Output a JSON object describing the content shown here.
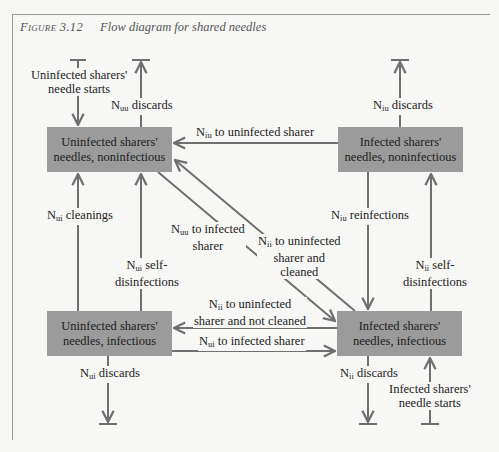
{
  "figure": {
    "number_label": "Figure 3.12",
    "title": "Flow diagram for shared needles"
  },
  "boxes": {
    "uninfected_noninfectious": "Uninfected sharers' needles, noninfectious",
    "infected_noninfectious": "Infected sharers' needles, noninfectious",
    "uninfected_infectious": "Uninfected sharers' needles, infectious",
    "infected_infectious": "Infected sharers' needles, infectious"
  },
  "flows": {
    "uninfected_starts": {
      "line1": "Uninfected sharers'",
      "line2": "needle starts"
    },
    "nuu_discards": {
      "sym": "N",
      "sub": "uu",
      "text": " discards"
    },
    "niu_discards": {
      "sym": "N",
      "sub": "iu",
      "text": " discards"
    },
    "niu_to_uninfected": {
      "sym": "N",
      "sub": "iu",
      "text": " to uninfected sharer"
    },
    "nui_cleanings": {
      "sym": "N",
      "sub": "ui",
      "text": " cleanings"
    },
    "nui_self": {
      "sym": "N",
      "sub": "ui",
      "text": " self-",
      "line2": "disinfections"
    },
    "nuu_to_infected": {
      "sym": "N",
      "sub": "uu",
      "text": " to infected",
      "line2": "sharer"
    },
    "nii_cleaned": {
      "sym": "N",
      "sub": "ii",
      "text": " to uninfected",
      "line2": "sharer and",
      "line3": "cleaned"
    },
    "niu_reinfections": {
      "sym": "N",
      "sub": "iu",
      "text": " reinfections"
    },
    "nii_self": {
      "sym": "N",
      "sub": "ii",
      "text": " self-",
      "line2": "disinfections"
    },
    "nii_not_cleaned": {
      "sym": "N",
      "sub": "ii",
      "text": " to uninfected",
      "line2": "sharer and not cleaned"
    },
    "nui_to_infected": {
      "sym": "N",
      "sub": "ui",
      "text": " to infected sharer"
    },
    "nui_discards": {
      "sym": "N",
      "sub": "ui",
      "text": " discards"
    },
    "nii_discards": {
      "sym": "N",
      "sub": "ii",
      "text": " discards"
    },
    "infected_starts": {
      "line1": "Infected sharers'",
      "line2": "needle starts"
    }
  },
  "colors": {
    "box_fill": "#9b9b9b",
    "arrow": "#6f6f6f",
    "background": "#f7f7f5"
  }
}
